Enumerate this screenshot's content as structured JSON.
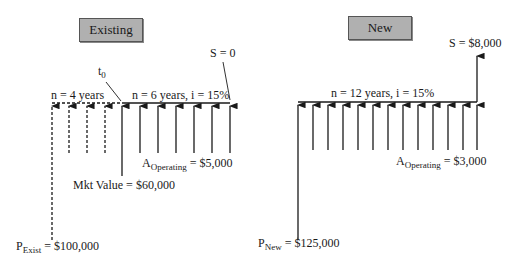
{
  "existing": {
    "title": "Existing",
    "t0_label": "t",
    "t0_sub": "0",
    "period1_label": "n = 4 years",
    "period2_label": "n = 6 years, i = 15%",
    "salvage_label": "S = 0",
    "operating_prefix": "A",
    "operating_sub": "Operating",
    "operating_value": " = $5,000",
    "market_value_label": "Mkt Value = $60,000",
    "initial_prefix": "P",
    "initial_sub": "Exist",
    "initial_value": " = $100,000",
    "past_arrows": 4,
    "annuity_arrows": 6
  },
  "new": {
    "title": "New",
    "period_label": "n = 12 years, i = 15%",
    "salvage_label": "S = $8,000",
    "operating_prefix": "A",
    "operating_sub": "Operating",
    "operating_value": " = $3,000",
    "initial_prefix": "P",
    "initial_sub": "New",
    "initial_value": " = $125,000",
    "annuity_arrows": 12
  },
  "colors": {
    "line": "#1a1a1a",
    "box_fill": "#b0b0b0"
  }
}
